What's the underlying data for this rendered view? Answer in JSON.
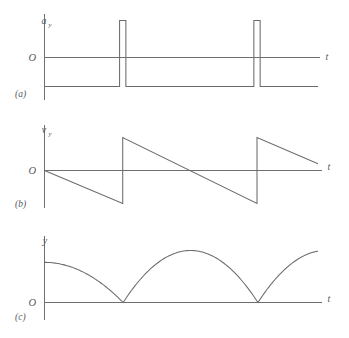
{
  "figure": {
    "background_color": "#ffffff",
    "line_color": "#6b6b6e",
    "axis_color": "#6f6f72",
    "text_color": "#58585c"
  },
  "panels": [
    {
      "key": "a",
      "panel_label": "(a)",
      "y_axis_label": "a",
      "y_axis_subscript": "y",
      "x_axis_label": "t",
      "origin_label": "O"
    },
    {
      "key": "b",
      "panel_label": "(b)",
      "y_axis_label": "v",
      "y_axis_subscript": "y",
      "x_axis_label": "t",
      "origin_label": "O"
    },
    {
      "key": "c",
      "panel_label": "(c)",
      "y_axis_label": "y",
      "y_axis_subscript": "",
      "x_axis_label": "t",
      "origin_label": "O"
    }
  ],
  "chart_data": [
    {
      "type": "line",
      "key": "a",
      "title": "",
      "xlabel": "t",
      "ylabel": "a_y",
      "grid": false,
      "legend": null,
      "xlim": [
        0,
        1
      ],
      "ylim": [
        -1.6,
        1.25
      ],
      "description": "Acceleration versus time for a bouncing ball: constant negative value (free fall, -g) interrupted by two narrow large positive spikes at the bounce instants.",
      "baseline_value": -0.62,
      "spike_value": 1.1,
      "spike_times": [
        0.286,
        0.777
      ],
      "spike_half_width": 0.0115,
      "series": [
        {
          "name": "a_y",
          "x": [
            0.0,
            0.2745,
            0.2745,
            0.2975,
            0.2975,
            0.7655,
            0.7655,
            0.7885,
            0.7885,
            1.0
          ],
          "y": [
            -0.62,
            -0.62,
            1.1,
            1.1,
            -0.62,
            -0.62,
            1.1,
            1.1,
            -0.62,
            -0.62
          ]
        }
      ]
    },
    {
      "type": "line",
      "key": "b",
      "title": "",
      "xlabel": "t",
      "ylabel": "v_y",
      "grid": false,
      "legend": null,
      "xlim": [
        0,
        1
      ],
      "ylim": [
        -1.0,
        1.0
      ],
      "description": "Velocity versus time: sawtooth wave. Velocity decreases linearly from zero (constant negative acceleration), then jumps discontinuously upward to a positive value at each bounce.",
      "bounce_times": [
        0.286,
        0.777
      ],
      "velocity_before_bounce": -0.72,
      "velocity_after_bounce": 0.72,
      "slope": -2.52,
      "series": [
        {
          "name": "v_y",
          "x": [
            0.0,
            0.286,
            0.286,
            0.777,
            0.777,
            1.0
          ],
          "y": [
            0.0,
            -0.72,
            0.72,
            -0.72,
            0.72,
            0.145
          ]
        }
      ]
    },
    {
      "type": "line",
      "key": "c",
      "title": "",
      "xlabel": "t",
      "ylabel": "y",
      "grid": false,
      "legend": null,
      "xlim": [
        0,
        1
      ],
      "ylim": [
        0,
        1.0
      ],
      "description": "Height versus time: successive parabolic arcs (projectile motion) that touch y = 0 at each bounce, forming sharp cusps at the ground contacts.",
      "bounce_times": [
        0.2875,
        0.7805
      ],
      "initial_height": 0.66,
      "arc_peak_height": 0.855,
      "arc_peak_times": [
        0.534
      ],
      "series": [
        {
          "name": "y",
          "arc_vertices": [
            {
              "t_peak": 0.0,
              "y_peak": 0.66,
              "t_start": 0.0,
              "t_end": 0.2875
            },
            {
              "t_peak": 0.534,
              "y_peak": 0.855,
              "t_start": 0.2875,
              "t_end": 0.7805
            },
            {
              "t_peak": 1.027,
              "y_peak": 0.855,
              "t_start": 0.7805,
              "t_end": 1.0
            }
          ]
        }
      ]
    }
  ]
}
